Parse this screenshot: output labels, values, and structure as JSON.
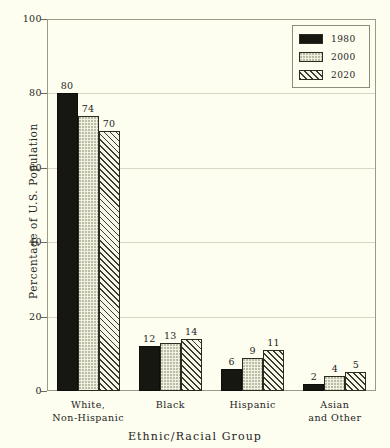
{
  "chart_data": {
    "type": "bar",
    "title": "",
    "xlabel": "Ethnic/Racial Group",
    "ylabel": "Percentage of U.S. Population",
    "ylim": [
      0,
      100
    ],
    "yticks": [
      0,
      20,
      40,
      60,
      80,
      100
    ],
    "grid": true,
    "legend_position": "top-right",
    "categories": [
      "White,\nNon-Hispanic",
      "Black",
      "Hispanic",
      "Asian\nand Other"
    ],
    "category_lines": [
      [
        "White,",
        "Non-Hispanic"
      ],
      [
        "Black",
        ""
      ],
      [
        "Hispanic",
        ""
      ],
      [
        "Asian",
        "and Other"
      ]
    ],
    "series": [
      {
        "name": "1980",
        "values": [
          80,
          12,
          6,
          2
        ],
        "fill": "solid",
        "color": "#171712"
      },
      {
        "name": "2000",
        "values": [
          74,
          13,
          9,
          4
        ],
        "fill": "dots",
        "color": "#f1f1e2"
      },
      {
        "name": "2020",
        "values": [
          70,
          14,
          11,
          5
        ],
        "fill": "hatch",
        "color": "#f5f5e8"
      }
    ]
  },
  "legend": {
    "items": [
      {
        "label": "1980",
        "swatch": "solid"
      },
      {
        "label": "2000",
        "swatch": "dots"
      },
      {
        "label": "2020",
        "swatch": "hatch"
      }
    ]
  },
  "axes": {
    "y_title": "Percentage of U.S. Population",
    "x_title": "Ethnic/Racial Group",
    "y_tick_labels": [
      "0",
      "20",
      "40",
      "60",
      "80",
      "100"
    ]
  },
  "colors": {
    "background": "#fdfdf0",
    "frame": "#9a9a86",
    "grid": "#d8d8c4",
    "text": "#24241c",
    "series_1980": "#171712",
    "series_2000": "#f1f1e2",
    "series_2020": "#f5f5e8"
  }
}
